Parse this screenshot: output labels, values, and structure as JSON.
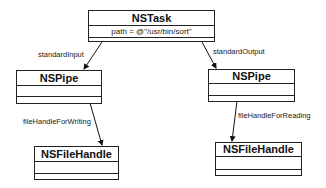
{
  "classes": {
    "task": {
      "name": "NSTask",
      "attribute": "path = @\"/usr/bin/sort\""
    },
    "pipe_in": {
      "name": "NSPipe"
    },
    "pipe_out": {
      "name": "NSPipe"
    },
    "handle_write": {
      "name": "NSFileHandle"
    },
    "handle_read": {
      "name": "NSFileHandle"
    }
  },
  "relations": {
    "standard_input": "standardInput",
    "standard_output": "standardOutput",
    "file_handle_for_writing": "fileHandleForWriting",
    "file_handle_for_reading": "fileHandleForReading"
  }
}
